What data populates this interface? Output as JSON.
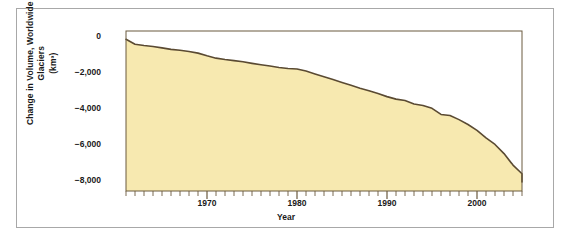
{
  "chart_data": {
    "type": "line",
    "title": "",
    "xlabel": "Year",
    "ylabel": "Change in Volume, Worldwide Glaciers (km³)",
    "ylabel_line1": "Change in Volume,",
    "ylabel_line2": "Worldwide Glaciers",
    "ylabel_line3": "(km³)",
    "xlim": [
      1961,
      2005
    ],
    "ylim": [
      -8600,
      300
    ],
    "grid": false,
    "legend": null,
    "yticks": [
      0,
      -2000,
      -4000,
      -6000,
      -8000
    ],
    "ytick_labels": [
      "0",
      "−2,000",
      "−4,000",
      "−6,000",
      "−8,000"
    ],
    "xticks": [
      1970,
      1980,
      1990,
      2000
    ],
    "xtick_labels": [
      "1970",
      "1980",
      "1990",
      "2000"
    ],
    "xtick_minor_interval": 1,
    "series_name": "Cumulative change in worldwide glacier volume",
    "x": [
      1961,
      1962,
      1963,
      1964,
      1965,
      1966,
      1967,
      1968,
      1969,
      1970,
      1971,
      1972,
      1973,
      1974,
      1975,
      1976,
      1977,
      1978,
      1979,
      1980,
      1981,
      1982,
      1983,
      1984,
      1985,
      1986,
      1987,
      1988,
      1989,
      1990,
      1991,
      1992,
      1993,
      1994,
      1995,
      1996,
      1997,
      1998,
      1999,
      2000,
      2001,
      2002,
      2003,
      2004,
      2005
    ],
    "values": [
      -160,
      -440,
      -510,
      -560,
      -640,
      -720,
      -770,
      -840,
      -930,
      -1080,
      -1210,
      -1290,
      -1350,
      -1410,
      -1500,
      -1580,
      -1650,
      -1730,
      -1790,
      -1810,
      -1930,
      -2090,
      -2240,
      -2400,
      -2560,
      -2720,
      -2880,
      -3020,
      -3180,
      -3350,
      -3490,
      -3570,
      -3760,
      -3840,
      -4000,
      -4340,
      -4400,
      -4630,
      -4900,
      -5230,
      -5650,
      -6010,
      -6520,
      -7160,
      -7640
    ],
    "end_value": -8100,
    "line_color": "#5a4a32",
    "fill_color": "#f7e9b0",
    "plot_border_color": "#6b5a3e",
    "frame_color": "#a8a8a8",
    "text_color": "#1a1a1a",
    "units": "km³",
    "data_description": "Cumulative change in volume of worldwide glaciers, 1961 to 2005, declining steadily from near zero to approximately -8,100 cubic kilometers"
  }
}
